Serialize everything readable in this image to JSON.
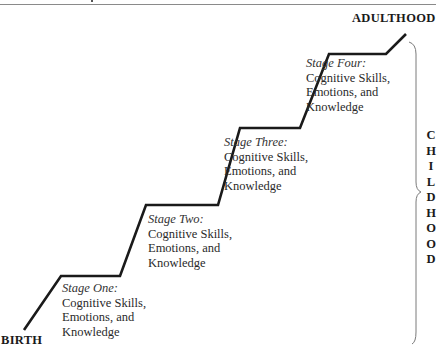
{
  "diagram": {
    "type": "staircase",
    "start_label": "BIRTH",
    "end_label": "ADULTHOOD",
    "bracket_label": "CHILDHOOD",
    "bracket_letters": [
      "C",
      "H",
      "I",
      "L",
      "D",
      "H",
      "O",
      "O",
      "D"
    ],
    "stages": [
      {
        "title": "Stage One:",
        "lines": [
          "Cognitive Skills,",
          "Emotions, and",
          "Knowledge"
        ]
      },
      {
        "title": "Stage Two:",
        "lines": [
          "Cognitive Skills,",
          "Emotions, and",
          "Knowledge"
        ]
      },
      {
        "title": "Stage Three:",
        "lines": [
          "Cognitive Skills,",
          "Emotions, and",
          "Knowledge"
        ]
      },
      {
        "title": "Stage Four:",
        "lines": [
          "Cognitive Skills,",
          "Emotions, and",
          "Knowledge"
        ]
      }
    ],
    "colors": {
      "line": "#1a1a1a",
      "text": "#2a2a2a",
      "bracket": "#777777"
    }
  }
}
